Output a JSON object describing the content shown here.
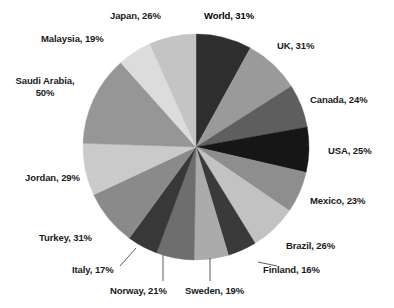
{
  "chart_data": {
    "type": "pie",
    "title": "",
    "subtitle": "",
    "xlabel": "",
    "ylabel": "",
    "legend_position": "none",
    "grid": false,
    "label_format": "{name}, {value}%",
    "start_angle_deg": 0,
    "direction": "clockwise",
    "units": "percent",
    "total_of_values": 388,
    "categories": [
      "World",
      "UK",
      "Canada",
      "USA",
      "Mexico",
      "Brazil",
      "Finland",
      "Sweden",
      "Norway",
      "Italy",
      "Turkey",
      "Jordan",
      "Saudi Arabia",
      "Malaysia",
      "Japan"
    ],
    "values": [
      31,
      31,
      24,
      25,
      23,
      26,
      16,
      19,
      21,
      17,
      31,
      29,
      50,
      19,
      26
    ],
    "slices": [
      {
        "name": "World",
        "value": 31,
        "label": "World, 31%",
        "color": "#2e2e2e",
        "emphasis": true,
        "leader_line": false
      },
      {
        "name": "UK",
        "value": 31,
        "label": "UK, 31%",
        "color": "#9a9a9a",
        "emphasis": false,
        "leader_line": false
      },
      {
        "name": "Canada",
        "value": 24,
        "label": "Canada, 24%",
        "color": "#5e5e5e",
        "emphasis": false,
        "leader_line": false
      },
      {
        "name": "USA",
        "value": 25,
        "label": "USA, 25%",
        "color": "#161616",
        "emphasis": false,
        "leader_line": false
      },
      {
        "name": "Mexico",
        "value": 23,
        "label": "Mexico, 23%",
        "color": "#8e8e8e",
        "emphasis": false,
        "leader_line": false
      },
      {
        "name": "Brazil",
        "value": 26,
        "label": "Brazil, 26%",
        "color": "#c2c2c2",
        "emphasis": false,
        "leader_line": false
      },
      {
        "name": "Finland",
        "value": 16,
        "label": "Finland, 16%",
        "color": "#3a3a3a",
        "emphasis": false,
        "leader_line": true
      },
      {
        "name": "Sweden",
        "value": 19,
        "label": "Sweden, 19%",
        "color": "#ababab",
        "emphasis": false,
        "leader_line": true
      },
      {
        "name": "Norway",
        "value": 21,
        "label": "Norway, 21%",
        "color": "#6e6e6e",
        "emphasis": false,
        "leader_line": true
      },
      {
        "name": "Italy",
        "value": 17,
        "label": "Italy, 17%",
        "color": "#383838",
        "emphasis": false,
        "leader_line": true
      },
      {
        "name": "Turkey",
        "value": 31,
        "label": "Turkey, 31%",
        "color": "#8a8a8a",
        "emphasis": false,
        "leader_line": false
      },
      {
        "name": "Jordan",
        "value": 29,
        "label": "Jordan, 29%",
        "color": "#cacaca",
        "emphasis": false,
        "leader_line": false
      },
      {
        "name": "Saudi Arabia",
        "value": 50,
        "label": "Saudi Arabia, 50%",
        "color": "#969696",
        "emphasis": false,
        "leader_line": false
      },
      {
        "name": "Malaysia",
        "value": 19,
        "label": "Malaysia, 19%",
        "color": "#dcdcdc",
        "emphasis": false,
        "leader_line": false
      },
      {
        "name": "Japan",
        "value": 26,
        "label": "Japan, 26%",
        "color": "#c4c4c4",
        "emphasis": false,
        "leader_line": false
      }
    ]
  },
  "labels": {
    "world": "World, 31%",
    "uk": "UK, 31%",
    "canada": "Canada, 24%",
    "usa": "USA, 25%",
    "mexico": "Mexico, 23%",
    "brazil": "Brazil, 26%",
    "finland": "Finland, 16%",
    "sweden": "Sweden, 19%",
    "norway": "Norway, 21%",
    "italy": "Italy, 17%",
    "turkey": "Turkey, 31%",
    "jordan": "Jordan, 29%",
    "saudi_arabia": "Saudi Arabia, 50%",
    "malaysia": "Malaysia, 19%",
    "japan": "Japan, 26%"
  },
  "geometry": {
    "center_x": 196,
    "center_y": 147,
    "radius": 113
  },
  "colors": {
    "background": "#ffffff",
    "text": "#1a1a1a",
    "leader_line": "#4a4a4a"
  }
}
